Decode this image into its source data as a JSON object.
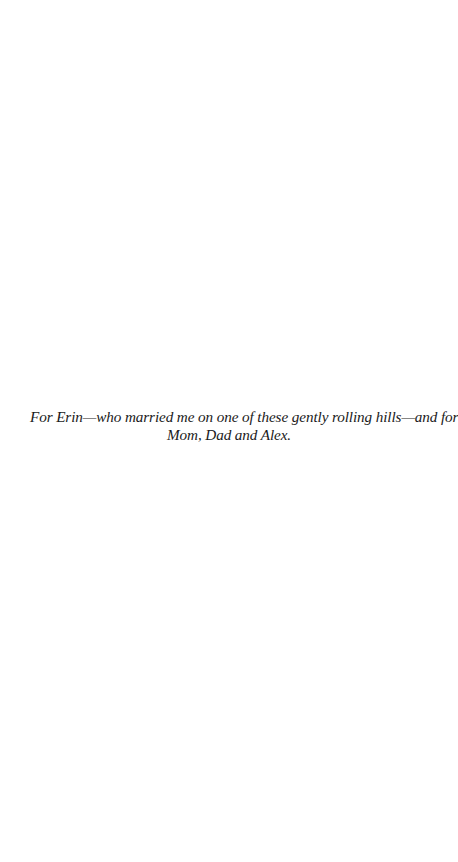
{
  "dedication": {
    "line1": "For Erin—who married me on one of these gently rolling hills—and for",
    "line2": "Mom, Dad and Alex."
  }
}
